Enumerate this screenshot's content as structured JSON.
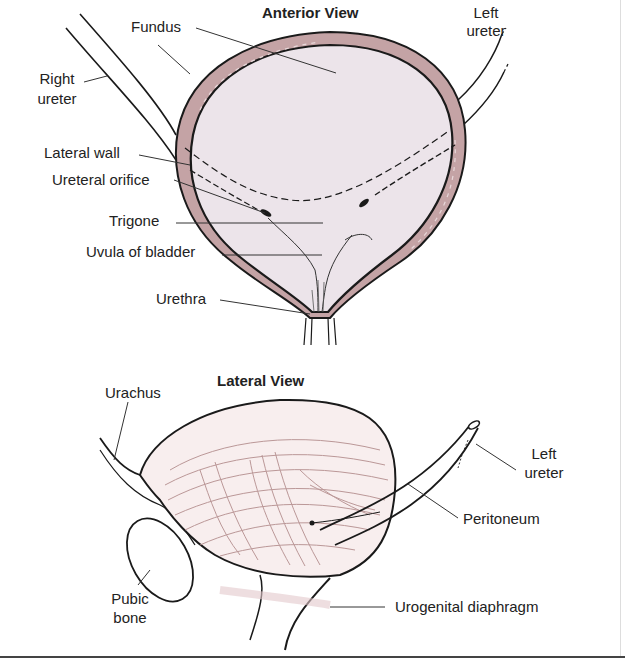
{
  "figure": {
    "anterior_view": {
      "title": "Anterior View",
      "labels": {
        "fundus": "Fundus",
        "right_ureter_1": "Right",
        "right_ureter_2": "ureter",
        "left_ureter_1": "Left",
        "left_ureter_2": "ureter",
        "lateral_wall": "Lateral wall",
        "ureteral_orifice": "Ureteral orifice",
        "trigone": "Trigone",
        "uvula": "Uvula of bladder",
        "urethra": "Urethra"
      }
    },
    "lateral_view": {
      "title": "Lateral View",
      "labels": {
        "urachus": "Urachus",
        "left_ureter_1": "Left",
        "left_ureter_2": "ureter",
        "peritoneum": "Peritoneum",
        "pubic_bone_1": "Pubic",
        "pubic_bone_2": "bone",
        "urogenital_diaphragm": "Urogenital diaphragm"
      }
    },
    "colors": {
      "outline": "#1a1a1a",
      "wall": "#c4a3a5",
      "lumen": "#ece4ea",
      "muscle": "#b58f8f",
      "leader": "#333333"
    }
  }
}
